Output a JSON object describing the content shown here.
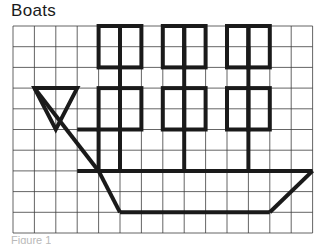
{
  "page": {
    "title": "Boats",
    "caption": "Figure 1",
    "background_color": "#ffffff"
  },
  "grid": {
    "origin_x": 13,
    "origin_y": 26,
    "cell_width": 21.4,
    "cell_height": 20.7,
    "columns": 14,
    "rows": 10,
    "line_color": "#3d3d3d",
    "line_width": 0.8
  },
  "drawing": {
    "name": "boat-on-grid",
    "stroke_color": "#1a1a1a",
    "stroke_width": 4,
    "squares_label": "cargo-squares",
    "top_row_squares": [
      {
        "col": 4,
        "row": 0
      },
      {
        "col": 5,
        "row": 0
      },
      {
        "col": 7,
        "row": 0
      },
      {
        "col": 8,
        "row": 0
      },
      {
        "col": 10,
        "row": 0
      },
      {
        "col": 11,
        "row": 0
      }
    ],
    "middle_row_squares": [
      {
        "col": 4,
        "row": 3
      },
      {
        "col": 5,
        "row": 3
      },
      {
        "col": 7,
        "row": 3
      },
      {
        "col": 8,
        "row": 3
      },
      {
        "col": 10,
        "row": 3
      },
      {
        "col": 11,
        "row": 3
      }
    ],
    "connector_masts_upper": [
      {
        "col": 5,
        "from_row": 1,
        "to_row": 3
      },
      {
        "col": 8,
        "from_row": 1,
        "to_row": 3
      },
      {
        "col": 11,
        "from_row": 1,
        "to_row": 3
      }
    ],
    "connector_masts_lower": [
      {
        "col": 5,
        "from_row": 5,
        "to_row": 7
      },
      {
        "col": 8,
        "from_row": 5,
        "to_row": 7
      },
      {
        "col": 11,
        "from_row": 5,
        "to_row": 7
      }
    ],
    "sail_triangle": [
      {
        "col": 1,
        "row": 3
      },
      {
        "col": 3,
        "row": 3
      },
      {
        "col": 2,
        "row": 5
      }
    ],
    "bow_box": {
      "col": 3,
      "row": 5,
      "width": 1,
      "height": 2
    },
    "mast_line": {
      "from": {
        "col": 1,
        "row": 3
      },
      "to": {
        "col": 4,
        "row": 7
      }
    },
    "deck_line": {
      "from": {
        "col": 3,
        "row": 7
      },
      "to": {
        "col": 14,
        "row": 7
      }
    },
    "hull_bottom_line": {
      "from": {
        "col": 5,
        "row": 9
      },
      "to": {
        "col": 12,
        "row": 9
      }
    },
    "hull_bow_diagonal": {
      "from": {
        "col": 4,
        "row": 7
      },
      "to": {
        "col": 5,
        "row": 9
      }
    },
    "hull_stern_diagonal": {
      "from": {
        "col": 14,
        "row": 7
      },
      "to": {
        "col": 12,
        "row": 9
      }
    }
  }
}
